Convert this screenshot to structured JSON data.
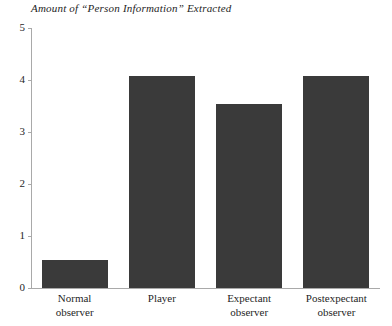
{
  "chart_data": {
    "type": "bar",
    "title": "Amount of “Person Information” Extracted",
    "xlabel": "",
    "ylabel": "",
    "ylim": [
      0,
      5
    ],
    "yticks": [
      "0",
      "1",
      "2",
      "3",
      "4",
      "5"
    ],
    "grid": false,
    "legend": false,
    "bar_color": "#3a3a3a",
    "axis_color": "#a9a9a9",
    "background_color": "#ffffff",
    "categories": [
      "Normal observer",
      "Player",
      "Expectant observer",
      "Postexpectant observer"
    ],
    "category_lines": [
      [
        "Normal",
        "observer"
      ],
      [
        "Player"
      ],
      [
        "Expectant",
        "observer"
      ],
      [
        "Postexpectant",
        "observer"
      ]
    ],
    "values": [
      0.54,
      4.08,
      3.54,
      4.08
    ]
  }
}
